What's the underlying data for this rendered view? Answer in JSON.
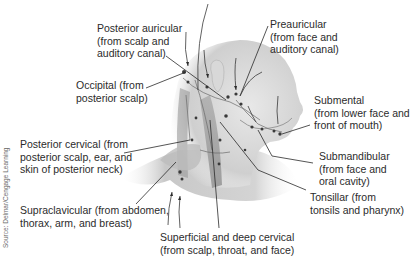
{
  "figure": {
    "credit": "Source: Delmar/Cengage Learning",
    "labels": [
      {
        "id": "posterior-auricular",
        "lines": [
          "Posterior auricular",
          "(from scalp and",
          "auditory canal)"
        ]
      },
      {
        "id": "preauricular",
        "lines": [
          "Preauricular",
          "(from face and",
          "auditory canal)"
        ]
      },
      {
        "id": "occipital",
        "lines": [
          "Occipital (from",
          "posterior scalp)"
        ]
      },
      {
        "id": "submental",
        "lines": [
          "Submental",
          "(from lower face and",
          "front of mouth)"
        ]
      },
      {
        "id": "posterior-cervical",
        "lines": [
          "Posterior cervical (from",
          "posterior scalp, ear, and",
          "skin of posterior neck)"
        ]
      },
      {
        "id": "submandibular",
        "lines": [
          "Submandibular",
          "(from face and",
          "oral cavity)"
        ]
      },
      {
        "id": "tonsillar",
        "lines": [
          "Tonsillar (from",
          "tonsils and pharynx)"
        ]
      },
      {
        "id": "supraclavicular",
        "lines": [
          "Supraclavicular (from abdomen,",
          "thorax, arm, and breast)"
        ]
      },
      {
        "id": "superficial-deep-cervical",
        "lines": [
          "Superficial and deep cervical",
          "(from scalp, throat, and face)"
        ]
      }
    ]
  }
}
